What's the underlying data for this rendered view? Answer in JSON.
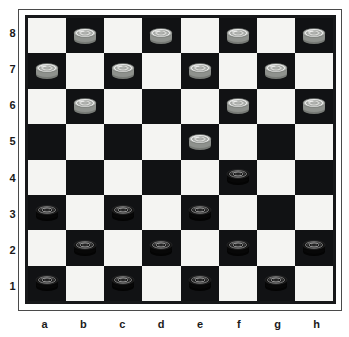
{
  "board": {
    "title": "Checkers position diagram",
    "files": [
      "a",
      "b",
      "c",
      "d",
      "e",
      "f",
      "g",
      "h"
    ],
    "ranks": [
      "8",
      "7",
      "6",
      "5",
      "4",
      "3",
      "2",
      "1"
    ],
    "size": 8,
    "colors": {
      "light_square": "#f4f4f2",
      "dark_square": "#111214",
      "frame": "#17181a",
      "light_piece": "#b9bbb8",
      "dark_piece": "#0b0b0b",
      "label_text": "#1b1b1b"
    },
    "dark_square_parity": "a1-dark",
    "pieces": [
      {
        "square": "b8",
        "color": "light",
        "type": "man"
      },
      {
        "square": "d8",
        "color": "light",
        "type": "man"
      },
      {
        "square": "f8",
        "color": "light",
        "type": "man"
      },
      {
        "square": "h8",
        "color": "light",
        "type": "man"
      },
      {
        "square": "a7",
        "color": "light",
        "type": "man"
      },
      {
        "square": "c7",
        "color": "light",
        "type": "man"
      },
      {
        "square": "e7",
        "color": "light",
        "type": "man"
      },
      {
        "square": "g7",
        "color": "light",
        "type": "man"
      },
      {
        "square": "b6",
        "color": "light",
        "type": "man"
      },
      {
        "square": "f6",
        "color": "light",
        "type": "man"
      },
      {
        "square": "h6",
        "color": "light",
        "type": "man"
      },
      {
        "square": "e5",
        "color": "light",
        "type": "man"
      },
      {
        "square": "f4",
        "color": "dark",
        "type": "man"
      },
      {
        "square": "a3",
        "color": "dark",
        "type": "man"
      },
      {
        "square": "c3",
        "color": "dark",
        "type": "man"
      },
      {
        "square": "e3",
        "color": "dark",
        "type": "man"
      },
      {
        "square": "b2",
        "color": "dark",
        "type": "man"
      },
      {
        "square": "d2",
        "color": "dark",
        "type": "man"
      },
      {
        "square": "f2",
        "color": "dark",
        "type": "man"
      },
      {
        "square": "h2",
        "color": "dark",
        "type": "man"
      },
      {
        "square": "a1",
        "color": "dark",
        "type": "man"
      },
      {
        "square": "c1",
        "color": "dark",
        "type": "man"
      },
      {
        "square": "e1",
        "color": "dark",
        "type": "man"
      },
      {
        "square": "g1",
        "color": "dark",
        "type": "man"
      }
    ],
    "counts": {
      "light_pieces": "12",
      "dark_pieces": "12"
    }
  }
}
